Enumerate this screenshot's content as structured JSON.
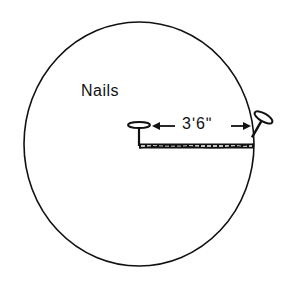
{
  "diagram": {
    "title_label": "Nails",
    "dimension_label": "3ʹ6ʺ",
    "elements": {
      "circle": "circle-outline",
      "center_nail": "nail-icon",
      "edge_nail": "nail-icon",
      "chain": "chain-line",
      "arrows": "double-arrow"
    },
    "colors": {
      "stroke": "#111111",
      "background": "#ffffff"
    }
  }
}
